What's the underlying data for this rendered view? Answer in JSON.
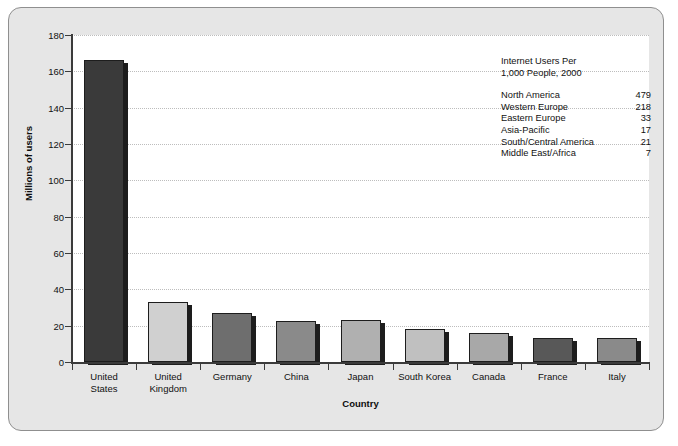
{
  "chart_data": {
    "type": "bar",
    "title": "",
    "xlabel": "Country",
    "ylabel": "Millions of users",
    "categories": [
      "United\nStates",
      "United\nKingdom",
      "Germany",
      "China",
      "Japan",
      "South Korea",
      "Canada",
      "France",
      "Italy"
    ],
    "values": [
      166,
      33,
      27,
      22.5,
      23,
      18,
      16,
      13,
      13
    ],
    "bar_colors": [
      "#3a3a3a",
      "#d0d0d0",
      "#6e6e6e",
      "#8a8a8a",
      "#b0b0b0",
      "#c0c0c0",
      "#a8a8a8",
      "#585858",
      "#8a8a8a"
    ],
    "ylim": [
      0,
      180
    ],
    "yticks": [
      0,
      20,
      40,
      60,
      80,
      100,
      120,
      140,
      160,
      180
    ],
    "ytick_labels": [
      "0",
      "20",
      "40",
      "60",
      "80",
      "100",
      "120",
      "140",
      "160",
      "180"
    ],
    "grid": true,
    "legend_position": "upper-right-inset"
  },
  "annotation": {
    "title": "Internet Users Per\n1,000 People, 2000",
    "rows": [
      {
        "region": "North America",
        "value": "479"
      },
      {
        "region": "Western Europe",
        "value": "218"
      },
      {
        "region": "Eastern Europe",
        "value": "33"
      },
      {
        "region": "Asia-Pacific",
        "value": "17"
      },
      {
        "region": "South/Central America",
        "value": "21"
      },
      {
        "region": "Middle East/Africa",
        "value": "7"
      }
    ]
  },
  "style": {
    "panel_background": "#e6e6e6",
    "panel_border": "#8f8f8f",
    "plot_background": "#ffffff",
    "axis_color": "#3b3b3b",
    "gridline_color": "#bdbdbd",
    "text_color": "#111111"
  }
}
